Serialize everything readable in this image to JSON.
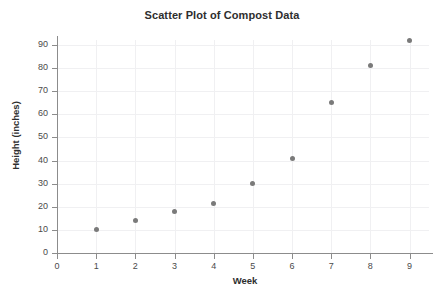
{
  "chart_data": {
    "type": "scatter",
    "title": "Scatter Plot of Compost Data",
    "xlabel": "Week",
    "ylabel": "Height (inches)",
    "x": [
      1,
      2,
      3,
      4,
      5,
      6,
      7,
      8,
      9
    ],
    "values": [
      10,
      14,
      18,
      21.5,
      30,
      41,
      65,
      81,
      92
    ],
    "series": [
      {
        "name": "Compost height",
        "points": [
          {
            "x": 1,
            "y": 10
          },
          {
            "x": 2,
            "y": 14
          },
          {
            "x": 3,
            "y": 18
          },
          {
            "x": 4,
            "y": 21.5
          },
          {
            "x": 5,
            "y": 30
          },
          {
            "x": 6,
            "y": 41
          },
          {
            "x": 7,
            "y": 65
          },
          {
            "x": 8,
            "y": 81
          },
          {
            "x": 9,
            "y": 92
          }
        ],
        "marker_color": "#7a7a7a"
      }
    ],
    "xlim": [
      0,
      9.6
    ],
    "ylim": [
      0,
      97
    ],
    "xticks": [
      0,
      1,
      2,
      3,
      4,
      5,
      6,
      7,
      8,
      9
    ],
    "yticks": [
      0,
      10,
      20,
      30,
      40,
      50,
      60,
      70,
      80,
      90
    ],
    "xtick_labels": [
      "0",
      "1",
      "2",
      "3",
      "4",
      "5",
      "6",
      "7",
      "8",
      "9"
    ],
    "ytick_labels": [
      "0",
      "10",
      "20",
      "30",
      "40",
      "50",
      "60",
      "70",
      "80",
      "90"
    ],
    "grid": true,
    "grid_color": "#f0f0f2",
    "legend": false,
    "legend_position": "none",
    "axis_color": "#8c8c8c",
    "background_color": "#ffffff"
  }
}
